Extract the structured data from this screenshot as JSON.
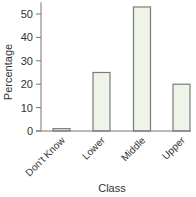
{
  "chart_data": {
    "type": "bar",
    "title": "",
    "xlabel": "Class",
    "ylabel": "Percentage",
    "categories": [
      "Don't Know",
      "Lower",
      "Middle",
      "Upper"
    ],
    "values": [
      1,
      25,
      53,
      20
    ],
    "ylim": [
      0,
      55
    ],
    "yticks": [
      0,
      10,
      20,
      30,
      40,
      50
    ],
    "grid": false,
    "legend": null,
    "colors": {
      "bar_fill": "#eef5e8",
      "bar_stroke": "#7a7a7a",
      "axis": "#777777",
      "text": "#333333"
    }
  }
}
